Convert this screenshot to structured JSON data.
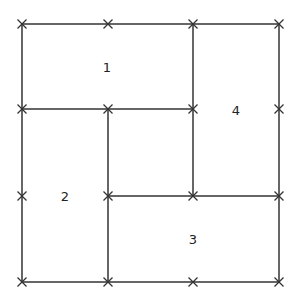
{
  "diagram": {
    "type": "rectangle-partition",
    "stroke_color": "#333333",
    "background": "#ffffff",
    "grid_x": [
      22,
      108,
      193,
      279
    ],
    "grid_y": [
      24,
      109,
      196,
      282
    ],
    "segments": [
      {
        "x1": 22,
        "y1": 24,
        "x2": 279,
        "y2": 24
      },
      {
        "x1": 22,
        "y1": 282,
        "x2": 279,
        "y2": 282
      },
      {
        "x1": 22,
        "y1": 24,
        "x2": 22,
        "y2": 282
      },
      {
        "x1": 279,
        "y1": 24,
        "x2": 279,
        "y2": 282
      },
      {
        "x1": 22,
        "y1": 109,
        "x2": 193,
        "y2": 109
      },
      {
        "x1": 193,
        "y1": 24,
        "x2": 193,
        "y2": 196
      },
      {
        "x1": 108,
        "y1": 196,
        "x2": 279,
        "y2": 196
      },
      {
        "x1": 108,
        "y1": 109,
        "x2": 108,
        "y2": 282
      }
    ],
    "markers": [
      [
        22,
        24
      ],
      [
        108,
        24
      ],
      [
        193,
        24
      ],
      [
        279,
        24
      ],
      [
        22,
        109
      ],
      [
        108,
        109
      ],
      [
        193,
        109
      ],
      [
        279,
        109
      ],
      [
        22,
        196
      ],
      [
        108,
        196
      ],
      [
        193,
        196
      ],
      [
        279,
        196
      ],
      [
        22,
        282
      ],
      [
        108,
        282
      ],
      [
        193,
        282
      ],
      [
        279,
        282
      ]
    ],
    "regions": [
      {
        "label": "1",
        "x": 107,
        "y": 67
      },
      {
        "label": "2",
        "x": 65,
        "y": 196
      },
      {
        "label": "3",
        "x": 193,
        "y": 239
      },
      {
        "label": "4",
        "x": 236,
        "y": 110
      }
    ]
  }
}
